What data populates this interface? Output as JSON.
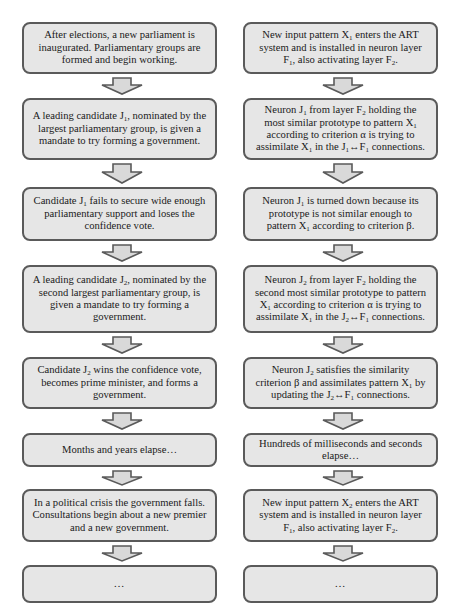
{
  "diagram": {
    "type": "parallel-flowchart",
    "colors": {
      "box_fill": "#e6e6e6",
      "box_border": "#5a5a5a",
      "arrow_fill": "#d9d9d9",
      "arrow_border": "#5a5a5a"
    },
    "left_column": {
      "topic": "parliamentary government formation",
      "steps": [
        {
          "html": "After elections, a new parliament is inaugurated. Parliamentary groups are formed and begin working."
        },
        {
          "html": "A leading candidate J<sub>1</sub>, nominated by the largest parliamentary group, is given a mandate to try forming a government."
        },
        {
          "html": "Candidate J<sub>1</sub> fails to secure wide enough parliamentary support and loses the confidence vote."
        },
        {
          "html": "A leading candidate J<sub>2</sub>, nominated by the second largest parliamentary group, is given a mandate to try forming a government."
        },
        {
          "html": "Candidate J<sub>2</sub> wins the confidence vote, becomes prime minister, and forms a government."
        },
        {
          "html": "Months and years elapse…"
        },
        {
          "html": "In a political crisis the government falls. Consultations begin about a new premier and a new government."
        },
        {
          "html": "<span class=\"ellipsis\">…</span>"
        }
      ]
    },
    "right_column": {
      "topic": "ART neural network pattern assimilation",
      "steps": [
        {
          "html": "New input pattern X<sub>1</sub> enters the ART system and is installed in neuron layer F<sub>1</sub>, also activating layer F<sub>2</sub>."
        },
        {
          "html": "Neuron J<sub>1</sub> from layer F<sub>2</sub> holding the most similar prototype to pattern X<sub>1</sub> according to criterion α is trying to assimilate X<sub>1</sub> in the J<sub>1</sub>↔F<sub>1</sub> connections."
        },
        {
          "html": "Neuron J<sub>1</sub> is turned down because its prototype is not similar enough to pattern X<sub>1</sub> according to criterion β."
        },
        {
          "html": "Neuron J<sub>2</sub> from layer F<sub>2</sub> holding the second most similar prototype to pattern X<sub>1</sub> according to criterion α is trying to assimilate X<sub>1</sub> in the J<sub>2</sub>↔F<sub>1</sub> connections."
        },
        {
          "html": "Neuron J<sub>2</sub> satisfies the similarity criterion β and assimilates pattern X<sub>1</sub> by updating the J<sub>2</sub>↔F<sub>1</sub> connections."
        },
        {
          "html": "Hundreds of milliseconds and seconds elapse…"
        },
        {
          "html": "New input pattern X<sub>2</sub> enters the ART system and is installed in neuron layer F<sub>1</sub>, also activating layer F<sub>2</sub>."
        },
        {
          "html": "<span class=\"ellipsis\">…</span>"
        }
      ]
    },
    "layout": {
      "boxes": [
        {
          "top": 22,
          "height": 52
        },
        {
          "top": 98,
          "height": 62
        },
        {
          "top": 187,
          "height": 54
        },
        {
          "top": 265,
          "height": 68
        },
        {
          "top": 357,
          "height": 52
        },
        {
          "top": 433,
          "height": 34
        },
        {
          "top": 489,
          "height": 53
        },
        {
          "top": 565,
          "height": 38
        }
      ]
    }
  }
}
